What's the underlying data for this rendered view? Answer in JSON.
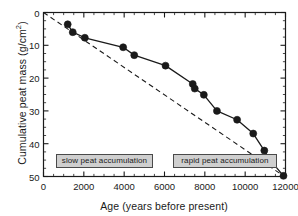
{
  "chart_data": {
    "type": "line",
    "title": "",
    "xlabel": "Age (years before present)",
    "ylabel": "Cumulative peat mass (g/cm2)",
    "ylabel_base": "Cumulative peat mass (g/cm",
    "ylabel_sup": "2",
    "ylabel_tail": ")",
    "xlim": [
      0,
      12000
    ],
    "ylim": [
      0,
      50
    ],
    "y_inverted": true,
    "grid": false,
    "legend": "none",
    "xticks": [
      0,
      2000,
      4000,
      6000,
      8000,
      10000,
      12000
    ],
    "xtick_labels": [
      "0",
      "2000",
      "4000",
      "6000",
      "8000",
      "10000",
      "12000"
    ],
    "x_minor_tick_interval": 500,
    "yticks": [
      0,
      10,
      20,
      30,
      40,
      50
    ],
    "ytick_labels": [
      "0",
      "10",
      "20",
      "30",
      "40",
      "50"
    ],
    "y_minor_tick_interval": 2.5,
    "series": [
      {
        "name": "Cumulative peat mass",
        "style": "solid-line-with-filled-circles",
        "color": "#1a1a1a",
        "marker": "circle",
        "x": [
          1200,
          1450,
          2050,
          3950,
          4500,
          6050,
          7400,
          7500,
          7950,
          8600,
          9600,
          10400,
          10950,
          11200,
          11900
        ],
        "y": [
          3.6,
          6.0,
          7.7,
          10.6,
          13.0,
          16.2,
          21.8,
          23.2,
          25.1,
          30.0,
          32.7,
          36.9,
          42.1,
          44.7,
          49.8
        ]
      },
      {
        "name": "Linear reference trend",
        "style": "dashed-line",
        "color": "#1a1a1a",
        "marker": "none",
        "x": [
          0,
          11900
        ],
        "y": [
          0,
          49.8
        ]
      }
    ],
    "annotations": [
      {
        "id": "slow-peat-accumulation",
        "text": "slow peat accumulation",
        "x_range": [
          600,
          5450
        ],
        "y_center": 45.2,
        "box_fill": "#cfcfcf",
        "box_border": "#4a4a4a"
      },
      {
        "id": "rapid-peat-accumulation",
        "text": "rapid peat accumulation",
        "x_range": [
          6400,
          11600
        ],
        "y_center": 45.2,
        "box_fill": "#cfcfcf",
        "box_border": "#4a4a4a"
      }
    ]
  },
  "axes": {
    "frame_color": "#1a1a1a"
  }
}
